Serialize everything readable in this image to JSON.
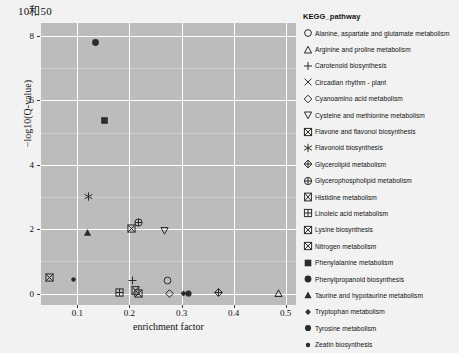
{
  "title": "10和50",
  "axes": {
    "xlabel": "enrichment factor",
    "ylabel": "−log10(Q-value)",
    "xticks": [
      "0.1",
      "0.2",
      "0.3",
      "0.4",
      "0.5"
    ],
    "yticks": [
      "0",
      "2",
      "4",
      "6",
      "8"
    ]
  },
  "legend": {
    "title": "KEGG_pathway",
    "items": [
      {
        "label": "Alanine, aspartate and glutamate metabolism",
        "marker": "circle-open"
      },
      {
        "label": "Arginine and proline metabolism",
        "marker": "triangle-up-open"
      },
      {
        "label": "Carotenoid biosynthesis",
        "marker": "plus"
      },
      {
        "label": "Circadian rhythm - plant",
        "marker": "cross-x"
      },
      {
        "label": "Cyanoamino acid metabolism",
        "marker": "diamond-open"
      },
      {
        "label": "Cysteine and methionine metabolism",
        "marker": "triangle-down-open"
      },
      {
        "label": "Flavone and flavonol biosynthesis",
        "marker": "square-x"
      },
      {
        "label": "Flavonoid biosynthesis",
        "marker": "asterisk"
      },
      {
        "label": "Glycerolipid metabolism",
        "marker": "diamond-plus"
      },
      {
        "label": "Glycerophospholipid metabolism",
        "marker": "circle-plus"
      },
      {
        "label": "Histidine metabolism",
        "marker": "square-bowtie"
      },
      {
        "label": "Linoleic acid metabolism",
        "marker": "square-plus"
      },
      {
        "label": "Lysine biosynthesis",
        "marker": "square-x-2"
      },
      {
        "label": "Nitrogen metabolism",
        "marker": "square-x-3"
      },
      {
        "label": "Phenylalanine metabolism",
        "marker": "square-filled"
      },
      {
        "label": "Phenylpropanoid biosynthesis",
        "marker": "circle-filled"
      },
      {
        "label": "Taurine and hypotaurine metabolism",
        "marker": "triangle-up-filled"
      },
      {
        "label": "Tryptophan metabolism",
        "marker": "diamond-filled-small"
      },
      {
        "label": "Tyrosine metabolism",
        "marker": "circle-filled-med"
      },
      {
        "label": "Zeatin biosynthesis",
        "marker": "circle-filled-small"
      }
    ]
  },
  "chart_data": {
    "type": "scatter",
    "title": "10和50",
    "xlabel": "enrichment factor",
    "ylabel": "−log10(Q-value)",
    "xlim": [
      0.03,
      0.52
    ],
    "ylim": [
      -0.35,
      8.4
    ],
    "grid": true,
    "legend_position": "right",
    "points": [
      {
        "name": "Phenylpropanoid biosynthesis",
        "marker": "circle-filled",
        "x": 0.133,
        "y": 7.8
      },
      {
        "name": "Phenylalanine metabolism",
        "marker": "square-filled",
        "x": 0.152,
        "y": 5.38
      },
      {
        "name": "Flavonoid biosynthesis",
        "marker": "asterisk",
        "x": 0.12,
        "y": 3.02
      },
      {
        "name": "Glycerophospholipid metabolism",
        "marker": "circle-plus",
        "x": 0.216,
        "y": 2.22
      },
      {
        "name": "Flavone and flavonol biosynthesis",
        "marker": "square-x",
        "x": 0.202,
        "y": 2.03
      },
      {
        "name": "Cysteine and methionine metabolism",
        "marker": "triangle-down-open",
        "x": 0.266,
        "y": 1.98
      },
      {
        "name": "Taurine and hypotaurine metabolism",
        "marker": "triangle-up-filled",
        "x": 0.119,
        "y": 1.9
      },
      {
        "name": "Nitrogen metabolism",
        "marker": "square-x-3",
        "x": 0.045,
        "y": 0.52
      },
      {
        "name": "Zeatin biosynthesis",
        "marker": "circle-filled-small",
        "x": 0.091,
        "y": 0.46
      },
      {
        "name": "Carotenoid biosynthesis",
        "marker": "plus",
        "x": 0.205,
        "y": 0.42
      },
      {
        "name": "Alanine, aspartate and glutamate metabolism",
        "marker": "circle-open",
        "x": 0.272,
        "y": 0.42
      },
      {
        "name": "Linoleic acid metabolism",
        "marker": "square-plus",
        "x": 0.18,
        "y": 0.05
      },
      {
        "name": "Histidine metabolism",
        "marker": "square-bowtie",
        "x": 0.211,
        "y": 0.12
      },
      {
        "name": "Lysine biosynthesis",
        "marker": "square-x-2",
        "x": 0.217,
        "y": 0.02
      },
      {
        "name": "Cyanoamino acid metabolism",
        "marker": "diamond-open",
        "x": 0.275,
        "y": 0.03
      },
      {
        "name": "Tryptophan metabolism",
        "marker": "diamond-filled-small",
        "x": 0.303,
        "y": 0.03
      },
      {
        "name": "Tyrosine metabolism",
        "marker": "circle-filled-med",
        "x": 0.313,
        "y": 0.03
      },
      {
        "name": "Glycerolipid metabolism",
        "marker": "diamond-plus",
        "x": 0.371,
        "y": 0.06
      },
      {
        "name": "Arginine and proline metabolism",
        "marker": "triangle-up-open",
        "x": 0.485,
        "y": 0.02
      }
    ]
  }
}
